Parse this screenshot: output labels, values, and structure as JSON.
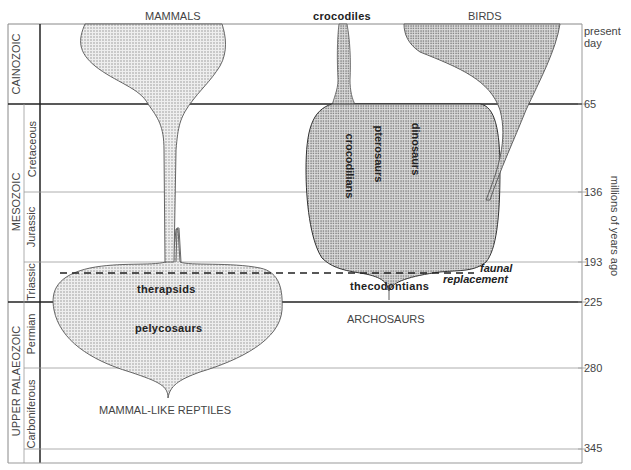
{
  "diagram": {
    "column_titles": {
      "mammals": "MAMMALS",
      "crocodiles": "crocodiles",
      "birds": "BIRDS"
    },
    "eras": [
      {
        "name": "CAINOZOIC"
      },
      {
        "name": "MESOZOIC"
      },
      {
        "name": "UPPER PALAEOZOIC"
      }
    ],
    "periods": [
      {
        "name": "Cretaceous"
      },
      {
        "name": "Jurassic"
      },
      {
        "name": "Triassic"
      },
      {
        "name": "Permian"
      },
      {
        "name": "Carboniferous"
      }
    ],
    "time_axis": {
      "label": "millions of years ago",
      "ticks": [
        "present day",
        "65",
        "136",
        "193",
        "225",
        "280",
        "345"
      ]
    },
    "groups": {
      "therapsids": "therapsids",
      "pelycosaurs": "pelycosaurs",
      "mammal_like_reptiles": "MAMMAL-LIKE REPTILES",
      "crocodilians": "crocodilians",
      "pterosaurs": "pterosaurs",
      "dinosaurs": "dinosaurs",
      "thecodontians": "thecodontians",
      "archosaurs": "ARCHOSAURS"
    },
    "annotation": {
      "line1": "faunal",
      "line2": "replacement"
    }
  }
}
